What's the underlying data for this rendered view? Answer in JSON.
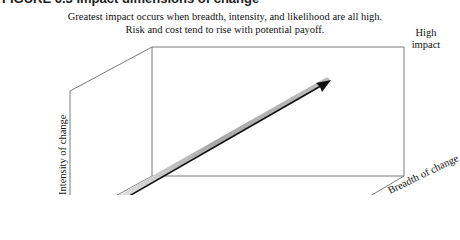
{
  "figure": {
    "heading_partial": "FIGURE 6.3   Impact dimensions of change",
    "caption_line1": "Greatest impact occurs when breadth, intensity, and likelihood are all high.",
    "caption_line2": "Risk and cost tend to rise with potential payoff.",
    "corner_label": "High impact",
    "axes": {
      "vertical": "Intensity of change",
      "depth": "Breadth of change"
    },
    "arrow": {
      "direction": "toward high impact",
      "color": "#111111",
      "shadow_color": "#b0b0b0"
    },
    "colors": {
      "line": "#7a7a7a",
      "text": "#111111"
    }
  }
}
